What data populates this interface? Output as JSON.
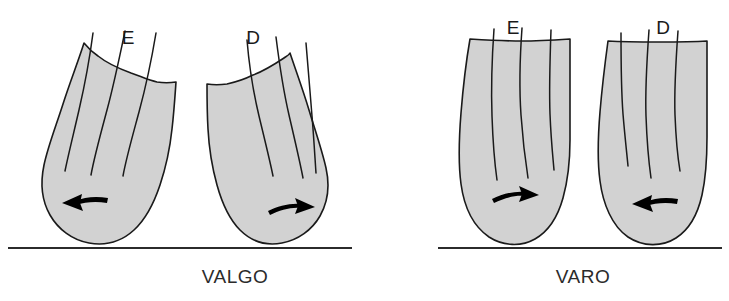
{
  "figure": {
    "title_visible": false,
    "background_color": "#ffffff",
    "limb_fill_color": "#d2d2d2",
    "outline_color": "#1a1a1a",
    "arrow_color": "#000000",
    "ground_color": "#2b2b2b"
  },
  "groups": [
    {
      "id": "valgo",
      "caption": "VALGO",
      "caption_x": 235,
      "caption_y": 283,
      "ground": {
        "x1": 8,
        "x2": 352,
        "y": 248
      },
      "limbs": [
        {
          "id": "valgo-left",
          "label": "E",
          "label_x": 128,
          "label_y": 44,
          "arrow_direction": "left",
          "arrow_icon": "arrow-left-icon"
        },
        {
          "id": "valgo-right",
          "label": "D",
          "label_x": 253,
          "label_y": 44,
          "arrow_direction": "right",
          "arrow_icon": "arrow-right-icon"
        }
      ]
    },
    {
      "id": "varo",
      "caption": "VARO",
      "caption_x": 583,
      "caption_y": 283,
      "ground": {
        "x1": 438,
        "x2": 722,
        "y": 248
      },
      "limbs": [
        {
          "id": "varo-left",
          "label": "E",
          "label_x": 513,
          "label_y": 34,
          "arrow_direction": "right",
          "arrow_icon": "arrow-right-icon"
        },
        {
          "id": "varo-right",
          "label": "D",
          "label_x": 663,
          "label_y": 34,
          "arrow_direction": "left",
          "arrow_icon": "arrow-left-icon"
        }
      ]
    }
  ]
}
